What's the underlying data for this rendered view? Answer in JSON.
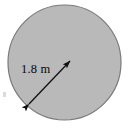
{
  "figure": {
    "type": "geometry-diagram",
    "background_color": "#ffffff",
    "width": 130,
    "height": 128
  },
  "shape": {
    "name": "circle",
    "fill_color": "#b9b9b9",
    "stroke_color": "#7a7a7a",
    "stroke_width": 1.2,
    "center_x": 64.5,
    "center_y": 62.5,
    "radius_x": 56.5,
    "radius_y": 57.5
  },
  "dimension": {
    "label": "1.8 m",
    "value": 1.8,
    "unit": "m",
    "measures": "diameter",
    "line_color": "#111111",
    "line_width": 1.3,
    "start_x": 29,
    "start_y": 104,
    "end_x": 70,
    "end_y": 61,
    "label_x": 21,
    "label_y": 73
  },
  "artifact": {
    "name": "edge-speck",
    "x": 3,
    "y": 92,
    "width": 3,
    "height": 5,
    "color": "#bdbdbd"
  }
}
